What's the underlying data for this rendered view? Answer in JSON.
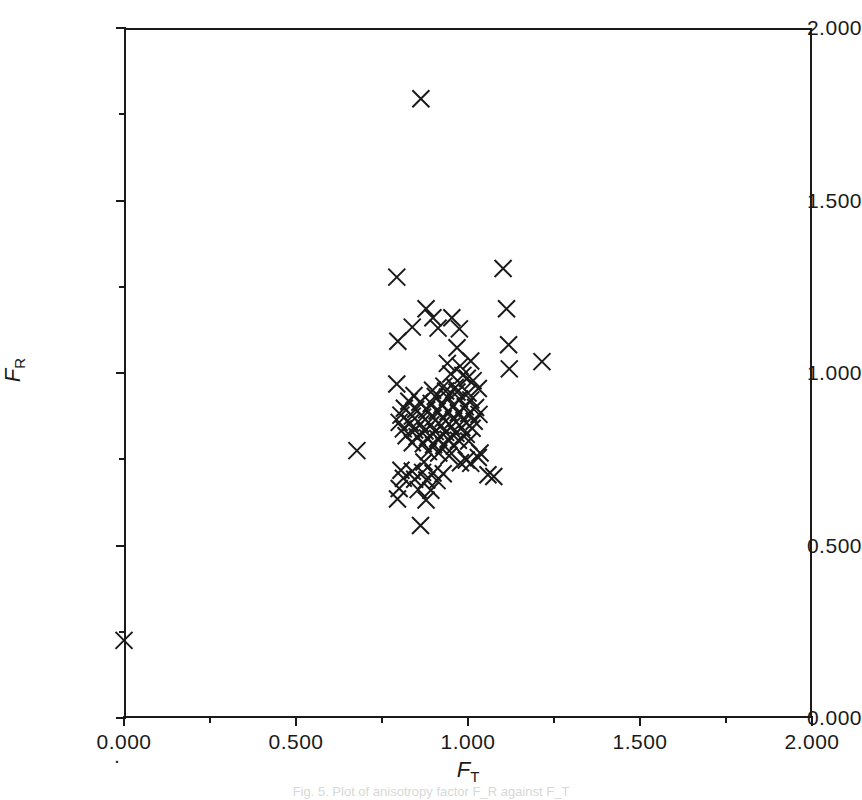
{
  "figure": {
    "background_color": "#ffffff",
    "ink_color": "#1a1a1a",
    "caption": "Fig. 5. Plot of anisotropy factor F_R against F_T"
  },
  "axes": {
    "y_title_symbol": "F",
    "y_title_sub": "R",
    "x_title_symbol": "F",
    "x_title_sub": "T",
    "origin_marker": "."
  },
  "chart_data": {
    "type": "scatter",
    "title": "",
    "xlabel": "F_T",
    "ylabel": "F_R",
    "xlim": [
      0.0,
      2.0
    ],
    "ylim": [
      0.0,
      2.0
    ],
    "grid": false,
    "legend": null,
    "marker": "x",
    "marker_color": "#1a1a1a",
    "x_ticks_major": [
      0.0,
      0.5,
      1.0,
      1.5,
      2.0
    ],
    "x_tick_labels": [
      "0.000",
      "0.500",
      "1.000",
      "1.500",
      "2.000"
    ],
    "x_ticks_minor": [
      0.25,
      0.75,
      1.25,
      1.75
    ],
    "y_ticks_major": [
      0.0,
      0.5,
      1.0,
      1.5,
      2.0
    ],
    "y_tick_labels": [
      "0.000",
      "0.500",
      "1.000",
      "1.500",
      "2.000"
    ],
    "y_ticks_minor": [
      0.25,
      0.75,
      1.25,
      1.75
    ],
    "n_points": 112,
    "points": [
      [
        0.0,
        0.225
      ],
      [
        0.863,
        1.795
      ],
      [
        0.793,
        1.278
      ],
      [
        1.102,
        1.303
      ],
      [
        0.878,
        1.186
      ],
      [
        1.112,
        1.186
      ],
      [
        0.898,
        1.16
      ],
      [
        0.953,
        1.16
      ],
      [
        0.838,
        1.133
      ],
      [
        0.913,
        1.13
      ],
      [
        0.975,
        1.128
      ],
      [
        0.796,
        1.092
      ],
      [
        1.118,
        1.082
      ],
      [
        0.968,
        1.073
      ],
      [
        1.008,
        1.035
      ],
      [
        1.215,
        1.033
      ],
      [
        0.94,
        1.028
      ],
      [
        0.977,
        1.02
      ],
      [
        1.12,
        1.012
      ],
      [
        0.95,
        0.997
      ],
      [
        0.985,
        0.993
      ],
      [
        0.998,
        0.985
      ],
      [
        1.015,
        0.978
      ],
      [
        0.793,
        0.968
      ],
      [
        0.93,
        0.962
      ],
      [
        0.963,
        0.958
      ],
      [
        1.03,
        0.955
      ],
      [
        0.897,
        0.95
      ],
      [
        0.935,
        0.948
      ],
      [
        0.968,
        0.945
      ],
      [
        1.0,
        0.942
      ],
      [
        0.843,
        0.935
      ],
      [
        0.905,
        0.932
      ],
      [
        0.94,
        0.93
      ],
      [
        0.975,
        0.925
      ],
      [
        1.008,
        0.922
      ],
      [
        0.828,
        0.918
      ],
      [
        0.86,
        0.915
      ],
      [
        0.893,
        0.912
      ],
      [
        0.925,
        0.908
      ],
      [
        0.958,
        0.905
      ],
      [
        0.992,
        0.902
      ],
      [
        1.022,
        0.9
      ],
      [
        0.815,
        0.898
      ],
      [
        0.848,
        0.895
      ],
      [
        0.88,
        0.893
      ],
      [
        0.91,
        0.89
      ],
      [
        0.942,
        0.888
      ],
      [
        0.972,
        0.885
      ],
      [
        1.002,
        0.883
      ],
      [
        1.032,
        0.88
      ],
      [
        0.805,
        0.878
      ],
      [
        0.838,
        0.875
      ],
      [
        0.868,
        0.872
      ],
      [
        0.898,
        0.87
      ],
      [
        0.928,
        0.868
      ],
      [
        0.958,
        0.865
      ],
      [
        0.988,
        0.862
      ],
      [
        1.018,
        0.86
      ],
      [
        0.8,
        0.857
      ],
      [
        0.832,
        0.855
      ],
      [
        0.862,
        0.852
      ],
      [
        0.892,
        0.85
      ],
      [
        0.922,
        0.848
      ],
      [
        0.952,
        0.845
      ],
      [
        0.982,
        0.842
      ],
      [
        1.012,
        0.84
      ],
      [
        0.812,
        0.838
      ],
      [
        0.845,
        0.835
      ],
      [
        0.875,
        0.832
      ],
      [
        0.905,
        0.83
      ],
      [
        0.935,
        0.828
      ],
      [
        0.965,
        0.825
      ],
      [
        0.995,
        0.822
      ],
      [
        0.82,
        0.818
      ],
      [
        0.852,
        0.815
      ],
      [
        0.882,
        0.812
      ],
      [
        0.912,
        0.81
      ],
      [
        0.942,
        0.808
      ],
      [
        0.972,
        0.805
      ],
      [
        1.002,
        0.803
      ],
      [
        0.838,
        0.798
      ],
      [
        0.87,
        0.795
      ],
      [
        0.9,
        0.792
      ],
      [
        0.93,
        0.79
      ],
      [
        0.96,
        0.788
      ],
      [
        0.677,
        0.775
      ],
      [
        0.885,
        0.772
      ],
      [
        0.915,
        0.768
      ],
      [
        1.035,
        0.768
      ],
      [
        0.945,
        0.76
      ],
      [
        1.03,
        0.755
      ],
      [
        0.995,
        0.748
      ],
      [
        0.872,
        0.742
      ],
      [
        0.978,
        0.74
      ],
      [
        1.008,
        0.738
      ],
      [
        0.805,
        0.718
      ],
      [
        0.838,
        0.715
      ],
      [
        0.868,
        0.712
      ],
      [
        0.898,
        0.71
      ],
      [
        0.928,
        0.708
      ],
      [
        1.058,
        0.705
      ],
      [
        1.075,
        0.7
      ],
      [
        0.812,
        0.695
      ],
      [
        0.845,
        0.692
      ],
      [
        0.88,
        0.69
      ],
      [
        0.91,
        0.688
      ],
      [
        0.8,
        0.665
      ],
      [
        0.855,
        0.662
      ],
      [
        0.892,
        0.66
      ],
      [
        0.795,
        0.635
      ],
      [
        0.878,
        0.632
      ],
      [
        0.862,
        0.558
      ]
    ]
  }
}
